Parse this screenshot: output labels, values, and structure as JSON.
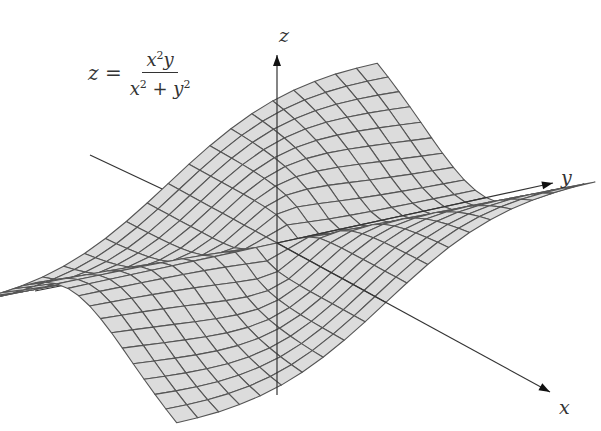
{
  "formula": {
    "lhs": "z =",
    "numerator": [
      "x",
      "2",
      "y"
    ],
    "denominator": [
      "x",
      "2",
      " + y",
      "2"
    ]
  },
  "axes": {
    "x_label": "x",
    "y_label": "y",
    "z_label": "z"
  },
  "surface": {
    "function": "x^2*y/(x^2+y^2)",
    "x_range": [
      -2,
      2
    ],
    "y_range": [
      -2,
      2
    ],
    "grid_divisions": 20,
    "fill_color": "#dcdcdc",
    "line_color": "#555555"
  },
  "colors": {
    "axis": "#333333",
    "background": "#ffffff"
  }
}
